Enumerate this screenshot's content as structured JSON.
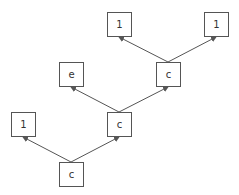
{
  "diagram": {
    "type": "tree",
    "colors": {
      "stroke": "#555555",
      "text": "#333333",
      "background": "#ffffff"
    },
    "nodes": [
      {
        "id": "n_root",
        "label": "c",
        "x": 59,
        "y": 162
      },
      {
        "id": "n_one_l",
        "label": "1",
        "x": 11,
        "y": 112
      },
      {
        "id": "n_c_mid",
        "label": "c",
        "x": 107,
        "y": 112
      },
      {
        "id": "n_e",
        "label": "e",
        "x": 59,
        "y": 62
      },
      {
        "id": "n_c_top",
        "label": "c",
        "x": 156,
        "y": 62
      },
      {
        "id": "n_one_a",
        "label": "1",
        "x": 107,
        "y": 12
      },
      {
        "id": "n_one_b",
        "label": "1",
        "x": 204,
        "y": 12
      }
    ],
    "edges": [
      {
        "from": "n_root",
        "to": "n_one_l"
      },
      {
        "from": "n_root",
        "to": "n_c_mid"
      },
      {
        "from": "n_c_mid",
        "to": "n_e"
      },
      {
        "from": "n_c_mid",
        "to": "n_c_top"
      },
      {
        "from": "n_c_top",
        "to": "n_one_a"
      },
      {
        "from": "n_c_top",
        "to": "n_one_b"
      }
    ]
  }
}
